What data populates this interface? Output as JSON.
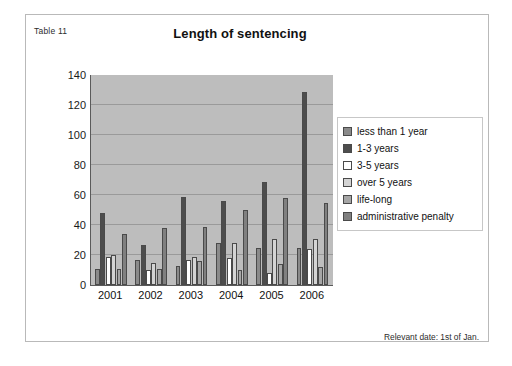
{
  "figure": {
    "caption": "Table 11",
    "footnote": "Relevant date: 1st of Jan."
  },
  "chart_data": {
    "type": "bar",
    "title": "Length of sentencing",
    "xlabel": "",
    "ylabel": "",
    "categories": [
      "2001",
      "2002",
      "2003",
      "2004",
      "2005",
      "2006"
    ],
    "series": [
      {
        "name": "less than 1 year",
        "color": "#8a8a8a",
        "values": [
          11,
          17,
          13,
          28,
          25,
          25
        ]
      },
      {
        "name": "1-3 years",
        "color": "#4d4d4d",
        "values": [
          48,
          27,
          59,
          56,
          69,
          129
        ]
      },
      {
        "name": "3-5 years",
        "color": "#ffffff",
        "values": [
          19,
          10,
          17,
          18,
          8,
          24
        ]
      },
      {
        "name": "over 5 years",
        "color": "#d4d4d4",
        "values": [
          20,
          15,
          19,
          28,
          31,
          31
        ]
      },
      {
        "name": "life-long",
        "color": "#a6a6a6",
        "values": [
          11,
          11,
          16,
          10,
          14,
          12
        ]
      },
      {
        "name": "administrative penalty",
        "color": "#808080",
        "values": [
          34,
          38,
          39,
          50,
          58,
          55
        ]
      }
    ],
    "ylim": [
      0,
      140
    ],
    "yticks": [
      0,
      20,
      40,
      60,
      80,
      100,
      120,
      140
    ],
    "grid": true,
    "legend_position": "right",
    "plot_background": "#bdbdbd"
  }
}
